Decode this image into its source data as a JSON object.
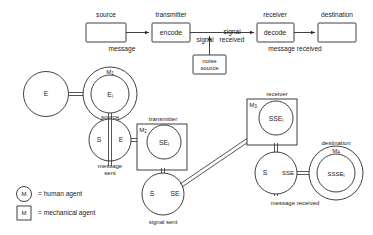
{
  "figure": {
    "title_top": "Shannon communication model",
    "top_model": {
      "boxes": [
        {
          "id": "source",
          "label": "source",
          "inner": ""
        },
        {
          "id": "transmitter",
          "label": "transmitter",
          "inner": "encode"
        },
        {
          "id": "receiver",
          "label": "receiver",
          "inner": "decode"
        },
        {
          "id": "destination",
          "label": "destination",
          "inner": ""
        },
        {
          "id": "noise",
          "label": "",
          "inner": "noise source",
          "inner_line1": "noise",
          "inner_line2": "source"
        }
      ],
      "edge_labels": [
        {
          "id": "message",
          "text": "message"
        },
        {
          "id": "signal",
          "text": "signal"
        },
        {
          "id": "signal-received",
          "text": "signal received",
          "line1": "signal",
          "line2": "received"
        },
        {
          "id": "message-received",
          "text": "message received"
        }
      ]
    },
    "bottom_model": {
      "nodes": [
        {
          "id": "e-plain",
          "type": "circle",
          "label": "E",
          "caption": ""
        },
        {
          "id": "m1-source",
          "type": "human-agent",
          "agent": "M",
          "agent_sub": "1",
          "label": "E",
          "label_sub": "i",
          "caption": "source"
        },
        {
          "id": "message-sent",
          "type": "split-circle",
          "left": "S",
          "right": "E",
          "caption": "message sent",
          "caption_line1": "message",
          "caption_line2": "sent"
        },
        {
          "id": "m2-transmitter",
          "type": "mech-agent",
          "agent": "M",
          "agent_sub": "2",
          "label": "SE",
          "label_sub": "i",
          "caption": "transmitter"
        },
        {
          "id": "signal-sent",
          "type": "split-circle",
          "left": "S",
          "right": "SE",
          "caption": "signal sent"
        },
        {
          "id": "m3-receiver",
          "type": "mech-agent",
          "agent": "M",
          "agent_sub": "3",
          "label": "SSE",
          "label_sub": "i",
          "caption": "receiver"
        },
        {
          "id": "signal-received-node",
          "type": "split-circle",
          "left": "S",
          "right": "SSE",
          "caption": "message received"
        },
        {
          "id": "m4-destination",
          "type": "human-agent",
          "agent": "M",
          "agent_sub": "4",
          "label": "SSSE",
          "label_sub": "i",
          "caption": "destination"
        }
      ]
    },
    "legend": [
      {
        "id": "legend-human",
        "symbol": "M",
        "shape": "circle",
        "text": "= human agent"
      },
      {
        "id": "legend-mechanical",
        "symbol": "M",
        "shape": "square",
        "text": "= mechanical agent"
      }
    ],
    "colors": {
      "ink": "#2b2b2b",
      "background": "#ffffff"
    }
  }
}
